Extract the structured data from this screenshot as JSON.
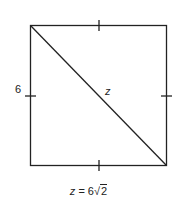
{
  "diagram": {
    "type": "square-with-diagonal",
    "side_label": "6",
    "diagonal_label": "z",
    "formula": {
      "variable": "z",
      "equals": " = 6",
      "radical_symbol": "√",
      "radicand": "2"
    },
    "colors": {
      "stroke": "#222222",
      "background": "#ffffff"
    }
  }
}
